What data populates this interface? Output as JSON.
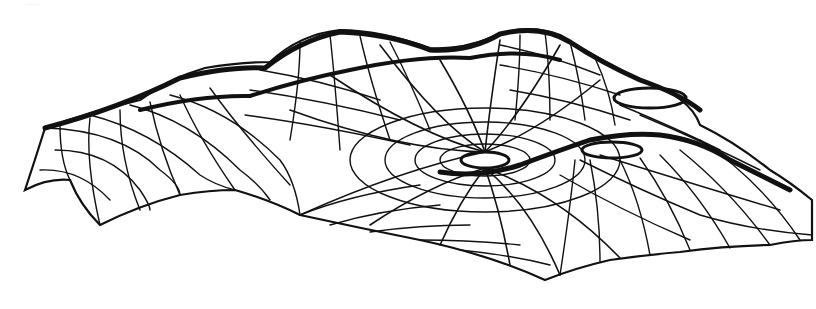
{
  "figure": {
    "top_fragment_text": "......",
    "colors": {
      "background": "#ffffff",
      "line": "#111111"
    },
    "features": {
      "peaks": [
        {
          "name": "left-dome",
          "cx": 215,
          "cy": 80
        },
        {
          "name": "center-left-dome",
          "cx": 330,
          "cy": 38
        },
        {
          "name": "center-right-dome",
          "cx": 525,
          "cy": 32
        },
        {
          "name": "right-ring-opening",
          "cx": 655,
          "cy": 98
        },
        {
          "name": "right-lower-ring",
          "cx": 615,
          "cy": 150
        }
      ],
      "central_opening": {
        "cx": 485,
        "cy": 160,
        "rx": 24,
        "ry": 8
      },
      "boundary_scallop_points": [
        [
          25,
          190
        ],
        [
          70,
          180
        ],
        [
          100,
          225
        ],
        [
          180,
          195
        ],
        [
          235,
          190
        ],
        [
          300,
          215
        ],
        [
          420,
          240
        ],
        [
          545,
          280
        ],
        [
          610,
          260
        ],
        [
          680,
          252
        ],
        [
          770,
          245
        ],
        [
          812,
          240
        ],
        [
          812,
          200
        ],
        [
          770,
          170
        ],
        [
          700,
          125
        ]
      ]
    }
  }
}
